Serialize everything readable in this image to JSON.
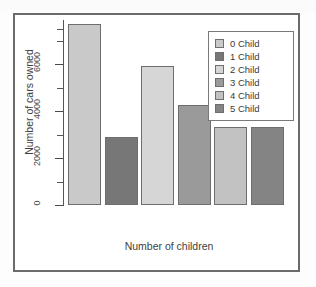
{
  "figure": {
    "axis_title_y": "Number of cars owned",
    "axis_title_x": "Number of children"
  },
  "legend": {
    "entries": [
      {
        "label": "0 Child",
        "color": "#c9c9c9"
      },
      {
        "label": "1 Child",
        "color": "#777777"
      },
      {
        "label": "2 Child",
        "color": "#d6d6d6"
      },
      {
        "label": "3 Child",
        "color": "#9a9a9a"
      },
      {
        "label": "4 Child",
        "color": "#c2c2c2"
      },
      {
        "label": "5 Child",
        "color": "#848484"
      }
    ]
  },
  "chart_data": {
    "type": "bar",
    "title": "",
    "xlabel": "Number of children",
    "ylabel": "Number of cars owned",
    "categories": [
      "0 Child",
      "1 Child",
      "2 Child",
      "3 Child",
      "4 Child",
      "5 Child"
    ],
    "values": [
      7700,
      2900,
      5900,
      4250,
      3300,
      3300
    ],
    "colors": [
      "#c9c9c9",
      "#777777",
      "#d6d6d6",
      "#9a9a9a",
      "#c2c2c2",
      "#848484"
    ],
    "ylim": [
      0,
      8000
    ],
    "ytick_labels": [
      "0",
      "2000",
      "4000",
      "6000"
    ],
    "ytick_values": [
      0,
      2000,
      4000,
      6000
    ],
    "yminor_step": 1000,
    "grid": false,
    "legend_position": "top-right",
    "xtick_labels": []
  }
}
